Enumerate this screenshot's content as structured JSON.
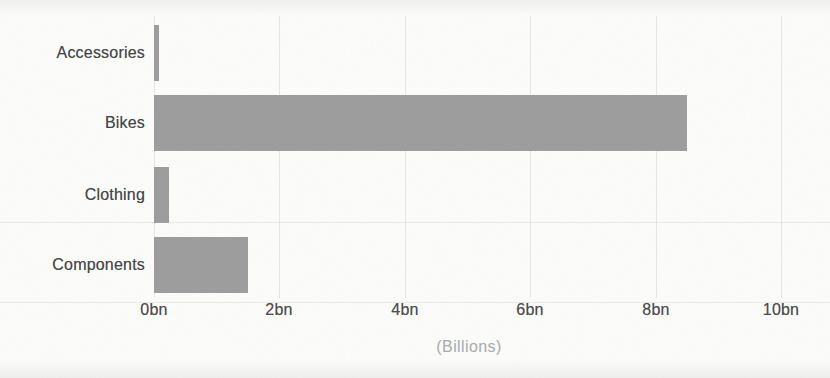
{
  "chart_data": {
    "type": "bar",
    "orientation": "horizontal",
    "categories": [
      "Accessories",
      "Bikes",
      "Clothing",
      "Components"
    ],
    "values": [
      0.08,
      8.5,
      0.24,
      1.5
    ],
    "title": "",
    "xlabel": "(Billions)",
    "ylabel": "",
    "xlim": [
      0,
      10
    ],
    "x_ticks": [
      {
        "value": 0,
        "label": "0bn"
      },
      {
        "value": 2,
        "label": "2bn"
      },
      {
        "value": 4,
        "label": "4bn"
      },
      {
        "value": 6,
        "label": "6bn"
      },
      {
        "value": 8,
        "label": "8bn"
      },
      {
        "value": 10,
        "label": "10bn"
      }
    ],
    "grid": "vertical-only",
    "legend": false,
    "colors": {
      "bar_fill": "#9c9c9c",
      "category_label": "#424242",
      "tick_label": "#474747",
      "axis_title": "#a9a9a9",
      "gridline": "#e7e7e7",
      "background": "#fdfdfc"
    }
  }
}
